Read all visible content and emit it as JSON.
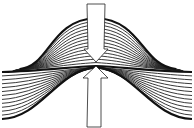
{
  "diagram": {
    "title": "",
    "colors": {
      "background": "#ffffff",
      "stroke": "#111111",
      "arrow_fill": "#ffffff"
    },
    "upper_fold": {
      "layers": 14,
      "peak": [
        96,
        18
      ]
    },
    "lower_fold": {
      "layers": 12,
      "peak": [
        96,
        67
      ]
    },
    "neutral_line_y": 71,
    "arrows": [
      {
        "name": "compression-down",
        "direction": "down",
        "tip": [
          96,
          62
        ]
      },
      {
        "name": "compression-up",
        "direction": "up",
        "tip": [
          96,
          65
        ]
      }
    ]
  }
}
